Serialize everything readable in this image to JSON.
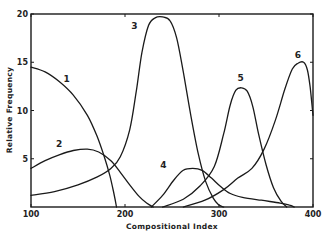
{
  "chart_data": {
    "type": "line",
    "title": "",
    "xlabel": "Compositional Index",
    "ylabel": "Relative Frequency",
    "xlim": [
      100,
      400
    ],
    "ylim": [
      0,
      20
    ],
    "x_ticks": [
      100,
      200,
      300,
      400
    ],
    "y_ticks": [
      5,
      10,
      15,
      20
    ],
    "x_tick_labels": [
      "100",
      "200",
      "300",
      "400"
    ],
    "y_tick_labels": [
      "5",
      "10",
      "15",
      "20"
    ],
    "grid": false,
    "legend": "none; curves labeled inline 1-6",
    "series": [
      {
        "name": "1",
        "label_pos": [
          138,
          13.0
        ],
        "points": [
          [
            100,
            14.5
          ],
          [
            115,
            14.0
          ],
          [
            130,
            13.0
          ],
          [
            145,
            11.6
          ],
          [
            160,
            9.5
          ],
          [
            170,
            7.4
          ],
          [
            178,
            5.2
          ],
          [
            184,
            3.2
          ],
          [
            188,
            1.5
          ],
          [
            191,
            0
          ]
        ]
      },
      {
        "name": "2",
        "label_pos": [
          130,
          6.2
        ],
        "points": [
          [
            100,
            4.0
          ],
          [
            115,
            4.8
          ],
          [
            130,
            5.4
          ],
          [
            145,
            5.85
          ],
          [
            160,
            6.0
          ],
          [
            172,
            5.7
          ],
          [
            185,
            4.8
          ],
          [
            195,
            3.6
          ],
          [
            205,
            2.3
          ],
          [
            215,
            1.1
          ],
          [
            223,
            0.4
          ],
          [
            230,
            0
          ]
        ]
      },
      {
        "name": "3",
        "label_pos": [
          210,
          18.4
        ],
        "points": [
          [
            100,
            1.2
          ],
          [
            125,
            1.6
          ],
          [
            150,
            2.3
          ],
          [
            170,
            3.1
          ],
          [
            185,
            4.0
          ],
          [
            195,
            5.2
          ],
          [
            205,
            8.0
          ],
          [
            212,
            12.0
          ],
          [
            218,
            16.0
          ],
          [
            225,
            18.8
          ],
          [
            232,
            19.6
          ],
          [
            240,
            19.7
          ],
          [
            248,
            19.3
          ],
          [
            255,
            17.5
          ],
          [
            262,
            14.0
          ],
          [
            270,
            9.5
          ],
          [
            278,
            5.5
          ],
          [
            286,
            2.6
          ],
          [
            294,
            0.9
          ],
          [
            300,
            0.2
          ],
          [
            305,
            0
          ]
        ]
      },
      {
        "name": "4",
        "label_pos": [
          241,
          4.0
        ],
        "points": [
          [
            228,
            0
          ],
          [
            240,
            1.2
          ],
          [
            252,
            2.8
          ],
          [
            262,
            3.8
          ],
          [
            272,
            4.0
          ],
          [
            282,
            3.8
          ],
          [
            292,
            3.0
          ],
          [
            302,
            2.1
          ],
          [
            312,
            1.4
          ],
          [
            325,
            1.0
          ],
          [
            345,
            0.7
          ],
          [
            365,
            0.4
          ],
          [
            375,
            0.2
          ],
          [
            380,
            0
          ]
        ]
      },
      {
        "name": "5",
        "label_pos": [
          323,
          13.1
        ],
        "points": [
          [
            240,
            0
          ],
          [
            262,
            0.8
          ],
          [
            280,
            2.2
          ],
          [
            295,
            4.2
          ],
          [
            305,
            7.6
          ],
          [
            312,
            10.6
          ],
          [
            318,
            12.1
          ],
          [
            324,
            12.35
          ],
          [
            330,
            12.0
          ],
          [
            336,
            10.4
          ],
          [
            342,
            7.6
          ],
          [
            350,
            4.4
          ],
          [
            358,
            2.0
          ],
          [
            366,
            0.6
          ],
          [
            372,
            0
          ]
        ]
      },
      {
        "name": "6",
        "label_pos": [
          384,
          15.4
        ],
        "points": [
          [
            262,
            0
          ],
          [
            285,
            0.7
          ],
          [
            305,
            1.8
          ],
          [
            320,
            3.0
          ],
          [
            335,
            4.0
          ],
          [
            348,
            6.0
          ],
          [
            360,
            9.0
          ],
          [
            370,
            12.2
          ],
          [
            378,
            14.3
          ],
          [
            384,
            14.9
          ],
          [
            390,
            15.0
          ],
          [
            394,
            14.2
          ],
          [
            397,
            12.4
          ],
          [
            400,
            9.5
          ]
        ]
      }
    ]
  }
}
